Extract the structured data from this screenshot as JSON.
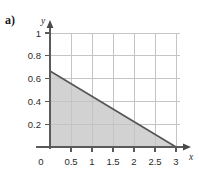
{
  "panel": {
    "label": "a)"
  },
  "chart_data": {
    "type": "area",
    "title": "",
    "subtitle": "",
    "xlabel": "x",
    "ylabel": "y",
    "xlim": [
      0,
      3.15
    ],
    "ylim": [
      0,
      1.1
    ],
    "xticks": [
      0,
      0.5,
      1,
      1.5,
      2,
      2.5,
      3
    ],
    "xticklabels": [
      "0",
      "0.5",
      "1",
      "1.5",
      "2",
      "2.5",
      "3"
    ],
    "yticks": [
      0.2,
      0.4,
      0.6,
      0.8,
      1
    ],
    "yticklabels": [
      "0.2",
      "0.4",
      "0.6",
      "0.8",
      "1"
    ],
    "grid": true,
    "grid_color": "#c8c8c8",
    "legend": null,
    "series": [
      {
        "name": "boundary-line",
        "type": "line",
        "x": [
          0,
          3
        ],
        "y": [
          0.667,
          0
        ],
        "color": "#555555",
        "width": 1.6
      },
      {
        "name": "shaded-region",
        "type": "area",
        "x": [
          0,
          3,
          0
        ],
        "y": [
          0.667,
          0,
          0
        ],
        "fill": "#d2d2d2",
        "description": "triangle bounded by the x-axis, the y-axis and the line from (0, 0.667) to (3, 0)"
      }
    ],
    "axis_color": "#555555",
    "axis_arrows": true,
    "y_intercept": 0.667,
    "x_intercept": 3
  }
}
